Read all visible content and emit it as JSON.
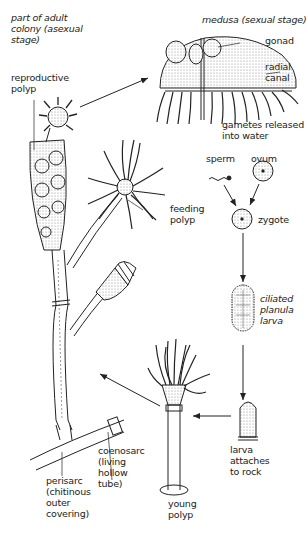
{
  "diagram": {
    "labels": {
      "adult_colony": "part of adult\ncolony (asexual\nstage)",
      "reproductive_polyp": "reproductive\npolyp",
      "medusa": "medusa (sexual stage)",
      "gonad": "gonad",
      "radial_canal": "radial\ncanal",
      "gametes": "gametes released\ninto water",
      "sperm": "sperm",
      "ovum": "ovum",
      "zygote": "zygote",
      "feeding_polyp": "feeding\npolyp",
      "planula": "ciliated\nplanula\nlarva",
      "larva_attaches": "larva\nattaches\nto rock",
      "young_polyp": "young\npolyp",
      "coenosarc": "coenosarc\n(living\nhollow\ntube)",
      "perisarc": "perisarc\n(chitinous\nouter\ncovering)"
    },
    "stages_sequence": [
      "reproductive polyp",
      "medusa",
      "gametes released into water",
      "sperm + ovum",
      "zygote",
      "ciliated planula larva",
      "larva attaches to rock",
      "young polyp",
      "adult colony"
    ],
    "colors": {
      "line": "#222222",
      "stipple": "#bdbdbd",
      "background": "#ffffff"
    }
  }
}
